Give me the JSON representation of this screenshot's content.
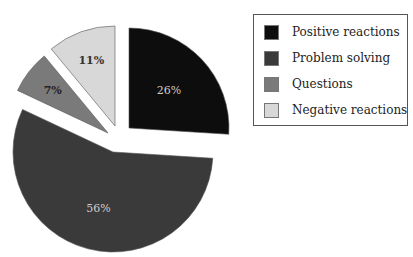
{
  "chart_data": {
    "type": "pie",
    "title": "",
    "categories": [
      "Positive reactions",
      "Problem solving",
      "Questions",
      "Negative reactions"
    ],
    "values": [
      26,
      56,
      7,
      11
    ],
    "labels": [
      "26%",
      "56%",
      "7%",
      "11%"
    ],
    "colors": [
      "#0d0d0d",
      "#3a3a3a",
      "#7a7a7a",
      "#d8d8d8"
    ],
    "exploded": true,
    "legend_position": "right"
  },
  "legend": {
    "items": [
      {
        "label": "Positive reactions",
        "color": "#0d0d0d"
      },
      {
        "label": "Problem solving",
        "color": "#3a3a3a"
      },
      {
        "label": "Questions",
        "color": "#7a7a7a"
      },
      {
        "label": "Negative reactions",
        "color": "#d8d8d8"
      }
    ]
  }
}
